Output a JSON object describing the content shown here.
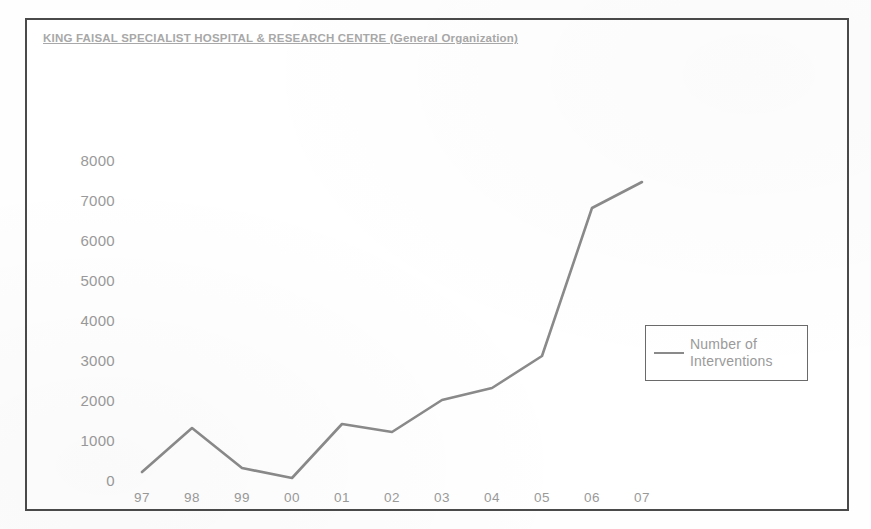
{
  "chart_data": {
    "type": "line",
    "title": "KING FAISAL SPECIALIST HOSPITAL & RESEARCH CENTRE (General Organization)",
    "xlabel": "",
    "ylabel": "",
    "categories": [
      "97",
      "98",
      "99",
      "00",
      "01",
      "02",
      "03",
      "04",
      "05",
      "06",
      "07"
    ],
    "series": [
      {
        "name": "Number of Interventions",
        "values": [
          200,
          1300,
          300,
          50,
          1400,
          1200,
          2000,
          2300,
          3100,
          6800,
          7450
        ],
        "color": "#8a8a8a"
      }
    ],
    "ylim": [
      0,
      8000
    ],
    "yticks": [
      0,
      1000,
      2000,
      3000,
      4000,
      5000,
      6000,
      7000,
      8000
    ],
    "ytick_labels": [
      "0",
      "1000",
      "2000",
      "3000",
      "4000",
      "5000",
      "6000",
      "7000",
      "8000"
    ],
    "grid": false,
    "legend_position": "right-middle"
  },
  "legend": {
    "entries": [
      {
        "label_line1": "Number of",
        "label_line2": "Interventions"
      }
    ]
  },
  "colors": {
    "series_line": "#8a8a8a",
    "axis_text": "#9a9a9a",
    "title_text": "#a8a8a8",
    "frame_border": "#4a4a4a",
    "legend_border": "#6a6a6a",
    "background": "#ffffff"
  }
}
